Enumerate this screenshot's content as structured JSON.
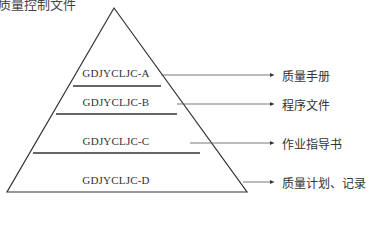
{
  "title": "质量控制文件",
  "pyramid": {
    "levels": [
      {
        "code": "GDJYCLJC-A",
        "document": "质量手册"
      },
      {
        "code": "GDJYCLJC-B",
        "document": "程序文件"
      },
      {
        "code": "GDJYCLJC-C",
        "document": "作业指导书"
      },
      {
        "code": "GDJYCLJC-D",
        "document": "质量计划、记录"
      }
    ]
  },
  "colors": {
    "line": "#333333",
    "text": "#333333",
    "background": "#ffffff"
  }
}
